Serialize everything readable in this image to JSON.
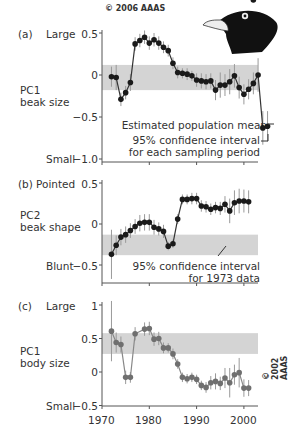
{
  "copyright_top": "© 2006 AAAS",
  "copyright_side": "© 2002 AAAS",
  "panels": [
    {
      "letter": "(a)",
      "top_label": "Large",
      "bottom_label": "Small",
      "axis_title_1": "PC1",
      "axis_title_2": "beak size",
      "ticks": [
        "0.5",
        "0",
        "−0.5",
        "−1.0"
      ],
      "ann_mean": "Estimated population mean",
      "ann_ci_1": "95% confidence interval",
      "ann_ci_2": "for each sampling period"
    },
    {
      "letter": "(b)",
      "top_label": "Pointed",
      "bottom_label": "Blunt",
      "axis_title_1": "PC2",
      "axis_title_2": "beak shape",
      "ticks": [
        "0.5",
        "0",
        "−0.5"
      ],
      "ann_ci_1": "95% confidence interval",
      "ann_ci_2": "for 1973 data"
    },
    {
      "letter": "(c)",
      "top_label": "Large",
      "bottom_label": "Small",
      "axis_title_1": "PC1",
      "axis_title_2": "body size",
      "ticks": [
        "1",
        "0.5",
        "0",
        "−0.5"
      ]
    }
  ],
  "x_ticks": [
    "1970",
    "1980",
    "1990",
    "2000"
  ],
  "colors": {
    "band": "#d4d4d4",
    "line_dark": "#333333",
    "point_dark": "#1a1a1a",
    "point_grey": "#6f6f6f",
    "err": "#999999"
  },
  "chart_data": [
    {
      "type": "line",
      "title": "(a) PC1 beak size",
      "ylabel": "PC1 beak size (Large ↔ Small)",
      "xlabel": "Year",
      "ylim": [
        -1.0,
        0.5
      ],
      "band_95ci_1973": [
        -0.18,
        0.12
      ],
      "x": [
        1972,
        1973,
        1974,
        1975,
        1976,
        1977,
        1978,
        1979,
        1980,
        1981,
        1982,
        1983,
        1984,
        1985,
        1986,
        1987,
        1988,
        1989,
        1990,
        1991,
        1992,
        1993,
        1994,
        1995,
        1996,
        1997,
        1998,
        1999,
        2000,
        2001,
        2002,
        2003,
        2004,
        2005
      ],
      "values": [
        -0.02,
        -0.03,
        -0.29,
        -0.21,
        -0.09,
        0.37,
        0.41,
        0.45,
        0.38,
        0.42,
        0.38,
        0.33,
        0.29,
        0.14,
        0.03,
        0.02,
        0.01,
        -0.01,
        -0.06,
        -0.07,
        -0.08,
        -0.07,
        -0.18,
        -0.12,
        -0.12,
        -0.08,
        -0.01,
        -0.15,
        -0.23,
        -0.17,
        -0.1,
        0.0,
        -0.63,
        -0.61
      ],
      "err": [
        0.12,
        0.15,
        0.08,
        0.08,
        0.1,
        0.08,
        0.08,
        0.08,
        0.08,
        0.08,
        0.08,
        0.07,
        0.07,
        0.07,
        0.07,
        0.06,
        0.07,
        0.06,
        0.08,
        0.09,
        0.09,
        0.09,
        0.12,
        0.15,
        0.13,
        0.15,
        0.14,
        0.13,
        0.12,
        0.12,
        0.13,
        0.2,
        0.2,
        0.18
      ],
      "annotations": [
        "Estimated population mean",
        "95% confidence interval for each sampling period"
      ]
    },
    {
      "type": "line",
      "title": "(b) PC2 beak shape",
      "ylabel": "PC2 beak shape (Pointed ↔ Blunt)",
      "xlabel": "Year",
      "ylim": [
        -0.5,
        0.5
      ],
      "band_95ci_1973": [
        -0.38,
        -0.13
      ],
      "x": [
        1972,
        1973,
        1974,
        1975,
        1976,
        1977,
        1978,
        1979,
        1980,
        1981,
        1982,
        1983,
        1984,
        1985,
        1986,
        1987,
        1988,
        1989,
        1990,
        1991,
        1992,
        1993,
        1994,
        1995,
        1996,
        1997,
        1998,
        1999,
        2000,
        2001,
        2002
      ],
      "values": [
        -0.37,
        -0.26,
        -0.16,
        -0.13,
        -0.08,
        -0.03,
        0.01,
        0.02,
        0.02,
        -0.04,
        -0.06,
        -0.09,
        -0.27,
        -0.24,
        0.06,
        0.3,
        0.3,
        0.31,
        0.31,
        0.22,
        0.21,
        0.18,
        0.2,
        0.19,
        0.24,
        0.16,
        0.26,
        0.28,
        0.28,
        0.27
      ],
      "err": [
        0.3,
        0.12,
        0.1,
        0.1,
        0.09,
        0.09,
        0.1,
        0.1,
        0.1,
        0.09,
        0.08,
        0.08,
        0.05,
        0.05,
        0.06,
        0.06,
        0.06,
        0.07,
        0.07,
        0.07,
        0.07,
        0.07,
        0.07,
        0.08,
        0.1,
        0.15,
        0.15,
        0.15,
        0.14,
        0.14
      ],
      "annotations": [
        "95% confidence interval for 1973 data"
      ]
    },
    {
      "type": "line",
      "title": "(c) PC1 body size",
      "ylabel": "PC1 body size (Large ↔ Small)",
      "xlabel": "Year",
      "xlim": [
        1970,
        2003
      ],
      "ylim": [
        -0.5,
        1.0
      ],
      "band_95ci_1973": [
        0.27,
        0.58
      ],
      "x": [
        1972,
        1973,
        1974,
        1975,
        1976,
        1977,
        1979,
        1980,
        1981,
        1982,
        1983,
        1984,
        1985,
        1986,
        1987,
        1988,
        1989,
        1990,
        1991,
        1992,
        1993,
        1994,
        1995,
        1996,
        1997,
        1998,
        1999,
        2000,
        2001
      ],
      "values": [
        0.61,
        0.44,
        0.41,
        -0.08,
        -0.08,
        0.57,
        0.64,
        0.65,
        0.49,
        0.5,
        0.36,
        0.36,
        0.27,
        0.12,
        -0.08,
        -0.1,
        -0.08,
        -0.11,
        -0.2,
        -0.23,
        -0.16,
        -0.14,
        -0.17,
        -0.09,
        -0.16,
        -0.04,
        -0.01,
        -0.24,
        -0.24
      ],
      "err": [
        0.45,
        0.15,
        0.12,
        0.1,
        0.08,
        0.1,
        0.1,
        0.1,
        0.1,
        0.1,
        0.08,
        0.07,
        0.08,
        0.07,
        0.07,
        0.07,
        0.07,
        0.07,
        0.07,
        0.08,
        0.1,
        0.12,
        0.1,
        0.15,
        0.22,
        0.15,
        0.22,
        0.13,
        0.12
      ]
    }
  ]
}
